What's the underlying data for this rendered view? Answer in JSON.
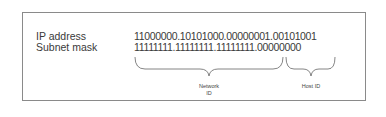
{
  "diagram": {
    "rows": [
      {
        "label": "IP address",
        "value": "11000000.10101000.00000001.00101001"
      },
      {
        "label": "Subnet mask",
        "value": "11111111.11111111.11111111.00000000"
      }
    ],
    "braces": [
      {
        "label_line1": "Network",
        "label_line2": "ID"
      },
      {
        "label_line1": "Host ID",
        "label_line2": ""
      }
    ],
    "colors": {
      "border": "#8a8a8a",
      "text": "#3a3a3a",
      "brace": "#666666"
    }
  }
}
